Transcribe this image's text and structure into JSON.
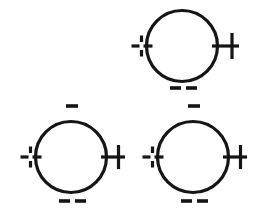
{
  "figure": {
    "background_color": "#ffffff",
    "stroke_color": "#151515",
    "width": 254,
    "height": 217
  },
  "chart_data": {
    "type": "diagram",
    "xlabel": "",
    "ylabel": "",
    "units": "pixels",
    "canvas": {
      "width": 254,
      "height": 217
    },
    "shapes": [
      {
        "id": "loop-top",
        "kind": "circle",
        "cx": 182,
        "cy": 46,
        "r": 35.5,
        "stroke_width": 3.2,
        "markers": [
          {
            "position": "left",
            "glyph": "dashed-plus",
            "symbol": "+",
            "count": 1
          },
          {
            "position": "right",
            "glyph": "solid-plus",
            "symbol": "+",
            "count": 1
          },
          {
            "position": "bottom",
            "glyph": "minus",
            "symbol": "−",
            "count": 2
          }
        ]
      },
      {
        "id": "loop-bottom-left",
        "kind": "circle",
        "cx": 71,
        "cy": 157,
        "r": 35.5,
        "stroke_width": 3.2,
        "markers": [
          {
            "position": "top",
            "glyph": "minus",
            "symbol": "−",
            "count": 1
          },
          {
            "position": "left",
            "glyph": "dashed-plus",
            "symbol": "+",
            "count": 1
          },
          {
            "position": "right",
            "glyph": "solid-plus",
            "symbol": "+",
            "count": 1
          },
          {
            "position": "bottom",
            "glyph": "minus",
            "symbol": "−",
            "count": 2
          }
        ]
      },
      {
        "id": "loop-bottom-right",
        "kind": "circle",
        "cx": 193,
        "cy": 157,
        "r": 35.5,
        "stroke_width": 3.2,
        "markers": [
          {
            "position": "top",
            "glyph": "minus",
            "symbol": "−",
            "count": 1
          },
          {
            "position": "left",
            "glyph": "dashed-plus",
            "symbol": "+",
            "count": 1
          },
          {
            "position": "right",
            "glyph": "solid-plus",
            "symbol": "+",
            "count": 1
          },
          {
            "position": "bottom",
            "glyph": "minus",
            "symbol": "−",
            "count": 2
          }
        ]
      }
    ],
    "legend": [],
    "annotations": []
  },
  "icons": {
    "plus": "plus-sign",
    "minus": "minus-sign",
    "dashed_plus": "segmented-plus-sign"
  }
}
